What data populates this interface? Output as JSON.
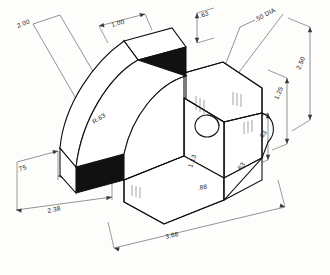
{
  "drawing": {
    "title": "Isometric Part Drawing",
    "view_type": "isometric",
    "units": "inches",
    "line_color": "#111111",
    "dimension_color": "#3a3a3a",
    "background_color": "#fdfdfc"
  },
  "dimensions": [
    {
      "id": "d1",
      "label": "2.00",
      "name": "overall-left-height-dim"
    },
    {
      "id": "d2",
      "label": "1.00",
      "name": "top-arm-width-dim"
    },
    {
      "id": "d3",
      "label": ".63",
      "name": "top-rear-thickness-dim"
    },
    {
      "id": "d4",
      "label": ".50 DIA",
      "name": "hole-diameter-dim"
    },
    {
      "id": "d5",
      "label": "2.50",
      "name": "overall-right-height-dim"
    },
    {
      "id": "d6",
      "label": "1.25",
      "name": "upper-right-height-dim"
    },
    {
      "id": "d7",
      "label": "R.63",
      "name": "fillet-radius-dim"
    },
    {
      "id": "d8",
      "label": ".75",
      "name": "left-foot-height-dim"
    },
    {
      "id": "d9",
      "label": ".75",
      "name": "left-foot-depth-dim"
    },
    {
      "id": "d10",
      "label": "2.38",
      "name": "left-overall-depth-dim"
    },
    {
      "id": "d11",
      "label": "1.13",
      "name": "center-vertical-dim"
    },
    {
      "id": "d12",
      "label": ".88",
      "name": "hole-center-offset-dim"
    },
    {
      "id": "d13",
      "label": ".63",
      "name": "right-base-width-dim"
    },
    {
      "id": "d14",
      "label": ".63",
      "name": "right-lower-height-dim"
    },
    {
      "id": "d15",
      "label": "3.88",
      "name": "overall-length-dim"
    }
  ]
}
